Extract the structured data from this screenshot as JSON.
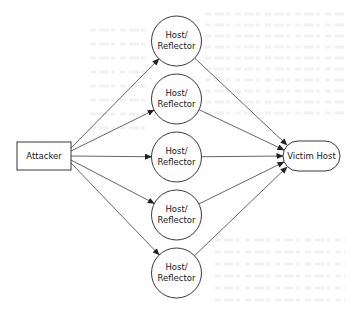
{
  "diagram": {
    "type": "flow",
    "title": "",
    "nodes": [
      {
        "id": "attacker",
        "label": "Attacker",
        "shape": "rectangle"
      },
      {
        "id": "reflector1",
        "label_lines": [
          "Host/",
          "Reflector"
        ],
        "shape": "circle"
      },
      {
        "id": "reflector2",
        "label_lines": [
          "Host/",
          "Reflector"
        ],
        "shape": "circle"
      },
      {
        "id": "reflector3",
        "label_lines": [
          "Host/",
          "Reflector"
        ],
        "shape": "circle"
      },
      {
        "id": "reflector4",
        "label_lines": [
          "Host/",
          "Reflector"
        ],
        "shape": "circle"
      },
      {
        "id": "reflector5",
        "label_lines": [
          "Host/",
          "Reflector"
        ],
        "shape": "circle"
      },
      {
        "id": "victim",
        "label": "Victim Host",
        "shape": "rounded-rectangle"
      }
    ],
    "edges": [
      {
        "from": "attacker",
        "to": "reflector1"
      },
      {
        "from": "attacker",
        "to": "reflector2"
      },
      {
        "from": "attacker",
        "to": "reflector3"
      },
      {
        "from": "attacker",
        "to": "reflector4"
      },
      {
        "from": "attacker",
        "to": "reflector5"
      },
      {
        "from": "reflector1",
        "to": "victim"
      },
      {
        "from": "reflector2",
        "to": "victim"
      },
      {
        "from": "reflector3",
        "to": "victim"
      },
      {
        "from": "reflector4",
        "to": "victim"
      },
      {
        "from": "reflector5",
        "to": "victim"
      }
    ],
    "colors": {
      "stroke": "#222222",
      "fill": "#ffffff",
      "text": "#1a1a1a"
    }
  }
}
